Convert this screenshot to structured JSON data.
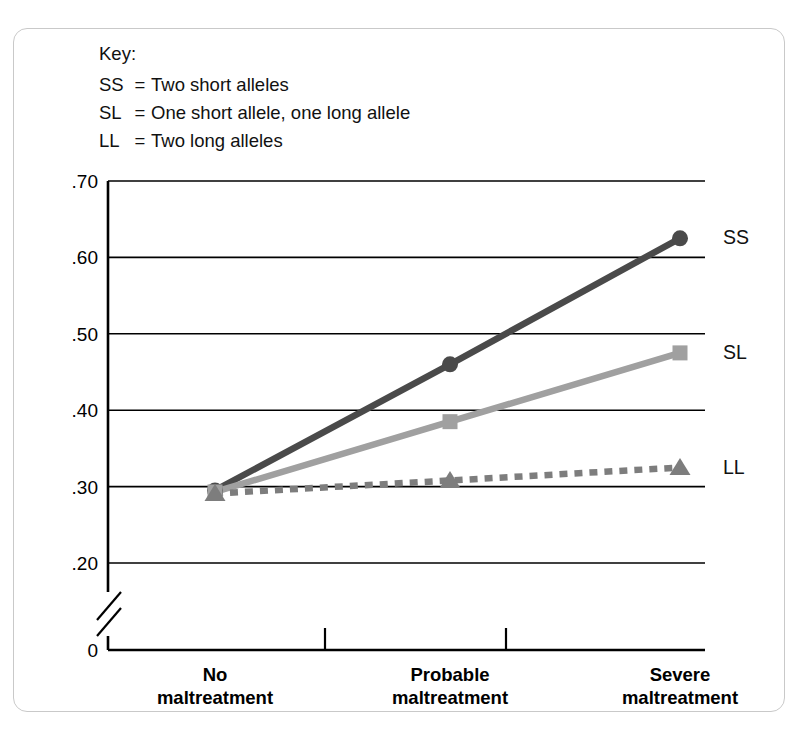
{
  "key": {
    "title": "Key:",
    "eq": "=",
    "entries": [
      {
        "code": "SS",
        "desc": "Two short alleles"
      },
      {
        "code": "SL",
        "desc": "One short allele, one long allele"
      },
      {
        "code": "LL",
        "desc": "Two long alleles"
      }
    ]
  },
  "chart_data": {
    "type": "line",
    "title": "",
    "xlabel": "",
    "ylabel": "Probability of major depression episode",
    "categories": [
      "No maltreatment",
      "Probable maltreatment",
      "Severe maltreatment"
    ],
    "category_lines": [
      [
        "No",
        "maltreatment"
      ],
      [
        "Probable",
        "maltreatment"
      ],
      [
        "Severe",
        "maltreatment"
      ]
    ],
    "ylim": [
      0.2,
      0.7
    ],
    "ytick_labels": [
      ".70",
      ".60",
      ".50",
      ".40",
      ".30",
      ".20",
      "0"
    ],
    "ytick_values": [
      0.7,
      0.6,
      0.5,
      0.4,
      0.3,
      0.2,
      0.0
    ],
    "axis_break": true,
    "grid": true,
    "legend_position": "right-of-lines",
    "series": [
      {
        "name": "SS",
        "label": "SS",
        "values": [
          0.295,
          0.46,
          0.625
        ],
        "color": "#4a4a4a",
        "marker": "circle",
        "dash": "solid"
      },
      {
        "name": "SL",
        "label": "SL",
        "values": [
          0.293,
          0.385,
          0.475
        ],
        "color": "#a0a0a0",
        "marker": "square",
        "dash": "solid"
      },
      {
        "name": "LL",
        "label": "LL",
        "values": [
          0.291,
          0.308,
          0.325
        ],
        "color": "#7d7d7d",
        "marker": "triangle",
        "dash": "dashed"
      }
    ]
  },
  "colors": {
    "frame": "#c9c9c9",
    "axis": "#000000",
    "grid": "#000000",
    "background": "#ffffff"
  }
}
